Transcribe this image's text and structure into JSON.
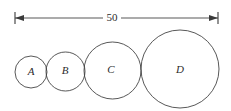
{
  "figure": {
    "background_color": "#ffffff",
    "stroke_color": "#3a3a3a",
    "text_color": "#2b2b2b",
    "width_px": 231,
    "height_px": 111
  },
  "dimension": {
    "label": "50",
    "value": 50,
    "units": "",
    "orientation": "horizontal",
    "y_px": 18,
    "start_x_px": 15,
    "end_x_px": 218,
    "label_x_px": 112,
    "left_arrow": "arrow-left",
    "right_arrow": "arrow-right"
  },
  "circles": [
    {
      "label": "A",
      "cx_px": 31,
      "cy_px": 72,
      "r_px": 16,
      "label_x_px": 31,
      "label_y_px": 72
    },
    {
      "label": "B",
      "cx_px": 65.5,
      "cy_px": 71.5,
      "r_px": 19.5,
      "label_x_px": 65,
      "label_y_px": 71
    },
    {
      "label": "C",
      "cx_px": 112.5,
      "cy_px": 70.5,
      "r_px": 28.5,
      "label_x_px": 111,
      "label_y_px": 70
    },
    {
      "label": "D",
      "cx_px": 180,
      "cy_px": 69,
      "r_px": 39,
      "label_x_px": 180,
      "label_y_px": 70
    }
  ]
}
